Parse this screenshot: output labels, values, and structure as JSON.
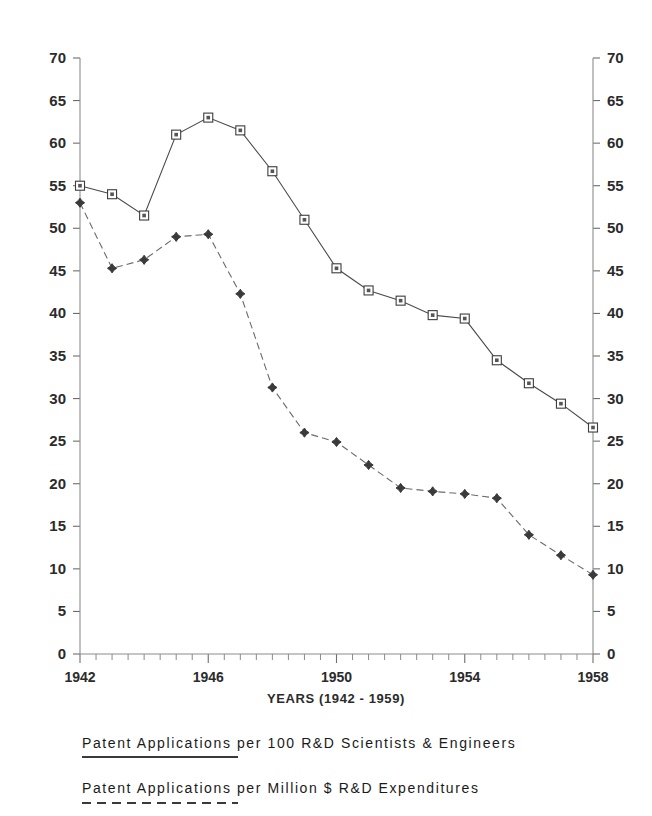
{
  "chart_data": {
    "type": "line",
    "title": "",
    "xlabel": "YEARS (1942 - 1959)",
    "ylabel": "",
    "xlim": [
      1942,
      1958
    ],
    "ylim": [
      0,
      70
    ],
    "grid": false,
    "legend_position": "below-plot",
    "x_tick_labels": [
      "1942",
      "1946",
      "1950",
      "1954",
      "1958"
    ],
    "x_tick_values": [
      1942,
      1946,
      1950,
      1954,
      1958
    ],
    "x_minor_step": 0.5,
    "y_tick_labels": [
      "0",
      "5",
      "10",
      "15",
      "20",
      "25",
      "30",
      "35",
      "40",
      "45",
      "50",
      "55",
      "60",
      "65",
      "70"
    ],
    "y_tick_values": [
      0,
      5,
      10,
      15,
      20,
      25,
      30,
      35,
      40,
      45,
      50,
      55,
      60,
      65,
      70
    ],
    "y_axis_left_labels": [
      "70",
      "65",
      "60",
      "55",
      "50",
      "45",
      "40",
      "35",
      "30",
      "25",
      "20",
      "15",
      "10",
      "5",
      "0"
    ],
    "y_axis_right_labels": [
      "70",
      "65",
      "60",
      "55",
      "50",
      "45",
      "40",
      "35",
      "30",
      "25",
      "20",
      "15",
      "10",
      "5",
      "0"
    ],
    "x": [
      1942,
      1942.5,
      1943,
      1943.5,
      1944,
      1944.5,
      1945,
      1945.5,
      1946,
      1946.5,
      1947,
      1947.5,
      1948,
      1948.5,
      1949,
      1949.5,
      1950,
      1950.5,
      1951,
      1951.5,
      1952,
      1952.5,
      1953,
      1953.5,
      1954,
      1954.5,
      1955,
      1955.5,
      1956,
      1956.5,
      1957,
      1957.5,
      1958
    ],
    "series": [
      {
        "name": "Patent Applications per 100 R&D Scientists & Engineers",
        "style": "solid",
        "marker": "square",
        "x": [
          1942,
          1943,
          1944,
          1945,
          1946,
          1947,
          1948,
          1949,
          1950,
          1951,
          1952,
          1953,
          1954,
          1955,
          1956,
          1957,
          1958
        ],
        "values": [
          55.0,
          54.0,
          51.5,
          61.0,
          63.0,
          61.5,
          56.7,
          51.0,
          45.3,
          42.7,
          41.5,
          39.8,
          39.4,
          34.5,
          31.8,
          29.4,
          26.6
        ]
      },
      {
        "name": "Patent Applications per Million $ R&D Expenditures",
        "style": "dashed",
        "marker": "star",
        "x": [
          1942,
          1943,
          1944,
          1945,
          1946,
          1947,
          1948,
          1949,
          1950,
          1951,
          1952,
          1953,
          1954,
          1955,
          1956,
          1957,
          1958
        ],
        "values": [
          53.0,
          45.3,
          46.3,
          49.0,
          49.3,
          42.3,
          31.3,
          26.0,
          24.9,
          22.2,
          19.5,
          19.1,
          18.8,
          18.3,
          14.0,
          11.6,
          9.3
        ]
      }
    ]
  },
  "axis": {
    "x_title": "YEARS (1942 - 1959)"
  },
  "legend": {
    "entries": [
      {
        "label": "Patent Applications per 100 R&D Scientists & Engineers",
        "style": "solid"
      },
      {
        "label": "Patent Applications per Million $ R&D Expenditures",
        "style": "dashed"
      }
    ]
  },
  "colors": {
    "background": "#ffffff",
    "axis": "#8c8c8c",
    "series_solid": "#4a4a4a",
    "series_dashed": "#6b6b6b",
    "text": "#1a1a1a"
  }
}
